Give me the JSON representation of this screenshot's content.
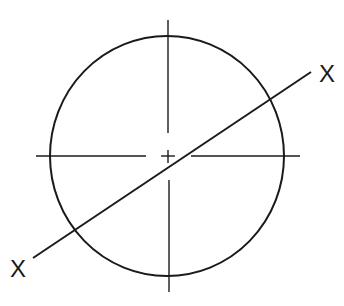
{
  "diagram": {
    "type": "circle-section-view",
    "labels": {
      "section_end_top": "X",
      "section_end_bottom": "X"
    },
    "colors": {
      "line": "#1a1a1a",
      "background": "#ffffff"
    },
    "elements": [
      "circle outline",
      "horizontal center line (broken)",
      "vertical center line (broken)",
      "center mark cross",
      "diagonal section line X-X"
    ]
  }
}
